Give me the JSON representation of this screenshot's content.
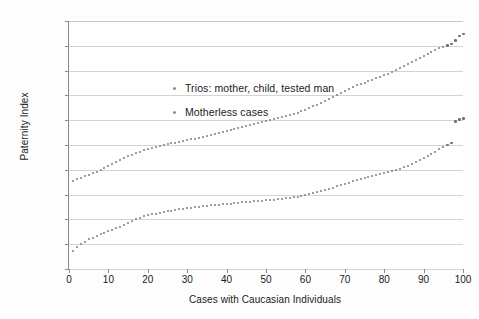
{
  "chart_data": {
    "type": "scatter",
    "title": "",
    "xlabel": "Cases with Caucasian Individuals",
    "ylabel": "Paternity Index",
    "xlim": [
      0,
      100
    ],
    "ylim": [
      100,
      1000000000000
    ],
    "yscale": "log",
    "grid": "horizontal",
    "legend_position": "upper-left-inside",
    "xticks": [
      "0",
      "10",
      "20",
      "30",
      "40",
      "50",
      "60",
      "70",
      "80",
      "90",
      "100"
    ],
    "xtick_values": [
      0,
      10,
      20,
      30,
      40,
      50,
      60,
      70,
      80,
      90,
      100
    ],
    "yticks": [
      "1.0E+02",
      "1.0E+03",
      "1.0E+04",
      "1.0E+05",
      "1.0E+06",
      "1.0E+07",
      "1.0E+08",
      "1.0E+09",
      "1.0E+10",
      "1.0E+11",
      "1.0E+12"
    ],
    "ytick_exponents": [
      2,
      3,
      4,
      5,
      6,
      7,
      8,
      9,
      10,
      11,
      12
    ],
    "marker_color": "#7d7d7d",
    "gridline_color": "#d4d4d4",
    "axis_color": "#8a8a8a",
    "series": [
      {
        "name": "Trios: mother, child, tested man",
        "marker": "dot",
        "x": [
          1,
          2,
          3,
          4,
          5,
          6,
          7,
          8,
          9,
          10,
          11,
          12,
          13,
          14,
          15,
          16,
          17,
          18,
          19,
          20,
          21,
          22,
          23,
          24,
          25,
          26,
          27,
          28,
          29,
          30,
          31,
          32,
          33,
          34,
          35,
          36,
          37,
          38,
          39,
          40,
          41,
          42,
          43,
          44,
          45,
          46,
          47,
          48,
          49,
          50,
          51,
          52,
          53,
          54,
          55,
          56,
          57,
          58,
          59,
          60,
          61,
          62,
          63,
          64,
          65,
          66,
          67,
          68,
          69,
          70,
          71,
          72,
          73,
          74,
          75,
          76,
          77,
          78,
          79,
          80,
          81,
          82,
          83,
          84,
          85,
          86,
          87,
          88,
          89,
          90,
          91,
          92,
          93,
          94,
          95,
          96,
          97,
          98,
          99,
          100
        ],
        "y_log10": [
          5.55,
          5.62,
          5.68,
          5.74,
          5.8,
          5.86,
          5.93,
          6.0,
          6.07,
          6.14,
          6.22,
          6.3,
          6.38,
          6.46,
          6.54,
          6.61,
          6.67,
          6.73,
          6.78,
          6.83,
          6.87,
          6.91,
          6.95,
          6.99,
          7.03,
          7.07,
          7.1,
          7.14,
          7.17,
          7.2,
          7.23,
          7.26,
          7.29,
          7.33,
          7.36,
          7.4,
          7.44,
          7.48,
          7.52,
          7.56,
          7.6,
          7.64,
          7.68,
          7.72,
          7.76,
          7.8,
          7.84,
          7.88,
          7.92,
          7.96,
          8.0,
          8.04,
          8.08,
          8.12,
          8.16,
          8.2,
          8.25,
          8.3,
          8.36,
          8.42,
          8.49,
          8.56,
          8.63,
          8.7,
          8.78,
          8.86,
          8.94,
          9.02,
          9.1,
          9.18,
          9.26,
          9.33,
          9.4,
          9.46,
          9.52,
          9.58,
          9.64,
          9.7,
          9.76,
          9.82,
          9.88,
          9.95,
          10.02,
          10.1,
          10.18,
          10.26,
          10.34,
          10.42,
          10.5,
          10.58,
          10.66,
          10.74,
          10.82,
          10.9,
          10.97,
          11.03,
          11.08,
          11.22,
          11.4,
          11.48
        ]
      },
      {
        "name": "Motherless cases",
        "marker": "dot",
        "x": [
          1,
          2,
          3,
          4,
          5,
          6,
          7,
          8,
          9,
          10,
          11,
          12,
          13,
          14,
          15,
          16,
          17,
          18,
          19,
          20,
          21,
          22,
          23,
          24,
          25,
          26,
          27,
          28,
          29,
          30,
          31,
          32,
          33,
          34,
          35,
          36,
          37,
          38,
          39,
          40,
          41,
          42,
          43,
          44,
          45,
          46,
          47,
          48,
          49,
          50,
          51,
          52,
          53,
          54,
          55,
          56,
          57,
          58,
          59,
          60,
          61,
          62,
          63,
          64,
          65,
          66,
          67,
          68,
          69,
          70,
          71,
          72,
          73,
          74,
          75,
          76,
          77,
          78,
          79,
          80,
          81,
          82,
          83,
          84,
          85,
          86,
          87,
          88,
          89,
          90,
          91,
          92,
          93,
          94,
          95,
          96,
          97,
          98,
          99,
          100
        ],
        "y_log10": [
          2.72,
          2.88,
          3.0,
          3.1,
          3.19,
          3.27,
          3.34,
          3.41,
          3.47,
          3.53,
          3.59,
          3.65,
          3.71,
          3.78,
          3.86,
          3.94,
          4.01,
          4.07,
          4.12,
          4.16,
          4.2,
          4.23,
          4.26,
          4.29,
          4.32,
          4.35,
          4.38,
          4.41,
          4.43,
          4.45,
          4.47,
          4.49,
          4.51,
          4.53,
          4.55,
          4.57,
          4.58,
          4.6,
          4.61,
          4.63,
          4.64,
          4.66,
          4.67,
          4.69,
          4.7,
          4.71,
          4.73,
          4.74,
          4.76,
          4.77,
          4.79,
          4.8,
          4.82,
          4.84,
          4.86,
          4.88,
          4.9,
          4.92,
          4.95,
          4.98,
          5.01,
          5.05,
          5.09,
          5.13,
          5.18,
          5.23,
          5.28,
          5.33,
          5.38,
          5.43,
          5.48,
          5.53,
          5.58,
          5.62,
          5.66,
          5.7,
          5.74,
          5.78,
          5.82,
          5.86,
          5.9,
          5.94,
          5.99,
          6.04,
          6.1,
          6.16,
          6.23,
          6.3,
          6.38,
          6.46,
          6.55,
          6.64,
          6.73,
          6.82,
          6.92,
          7.02,
          7.1,
          7.95,
          8.05,
          8.08
        ]
      }
    ]
  },
  "legend": {
    "items": [
      {
        "label": "Trios: mother, child, tested man"
      },
      {
        "label": "Motherless cases"
      }
    ]
  }
}
